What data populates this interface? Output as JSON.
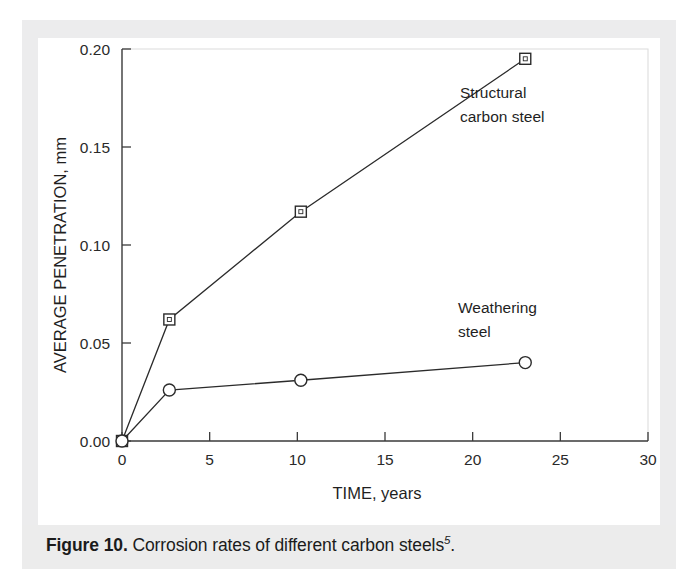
{
  "caption": {
    "figure_label": "Figure 10.",
    "text": " Corrosion rates of different carbon steels",
    "superscript": "5",
    "period": "."
  },
  "chart_data": {
    "type": "line",
    "title": "",
    "xlabel": "TIME, years",
    "ylabel": "AVERAGE PENETRATION, mm",
    "xlim": [
      0,
      30
    ],
    "ylim": [
      0,
      0.2
    ],
    "xticks": [
      0,
      5,
      10,
      15,
      20,
      25,
      30
    ],
    "xtick_labels": [
      "0",
      "5",
      "10",
      "15",
      "20",
      "25",
      "30"
    ],
    "yticks": [
      0.0,
      0.05,
      0.1,
      0.15,
      0.2
    ],
    "ytick_labels": [
      "0.00",
      "0.05",
      "0.10",
      "0.15",
      "0.20"
    ],
    "grid": false,
    "legend": "annotations-inline",
    "series": [
      {
        "name": "Structural carbon steel",
        "marker": "square",
        "x": [
          0,
          2.7,
          10.2,
          23.0
        ],
        "values": [
          0.0,
          0.062,
          0.117,
          0.195
        ],
        "annotation": {
          "line1": "Structural",
          "line2": "carbon steel"
        }
      },
      {
        "name": "Weathering steel",
        "marker": "circle",
        "x": [
          0,
          2.7,
          10.2,
          23.0
        ],
        "values": [
          0.0,
          0.026,
          0.031,
          0.04
        ],
        "annotation": {
          "line1": "Weathering",
          "line2": "steel"
        }
      }
    ]
  },
  "colors": {
    "ink": "#2b2b2b",
    "frame": "#dcdcdc",
    "page_band": "#ececed",
    "card": "#ffffff"
  }
}
